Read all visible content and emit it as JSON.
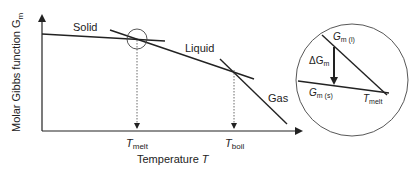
{
  "diagram": {
    "y_axis_label": "Molar Gibbs function G",
    "y_axis_sub": "m",
    "x_axis_label": "Temperature ",
    "x_axis_var": "T",
    "phases": {
      "solid": "Solid",
      "liquid": "Liquid",
      "gas": "Gas"
    },
    "ticks": {
      "melt_main": "T",
      "melt_sub": "melt",
      "boil_main": "T",
      "boil_sub": "boil"
    },
    "inset": {
      "g_liquid_main": "G",
      "g_liquid_sub": "m (l)",
      "g_solid_main": "G",
      "g_solid_sub": "m (s)",
      "delta_main": "ΔG",
      "delta_sub": "m",
      "tmelt_main": "T",
      "tmelt_sub": "melt"
    },
    "colors": {
      "line": "#222222",
      "background": "#ffffff"
    }
  }
}
